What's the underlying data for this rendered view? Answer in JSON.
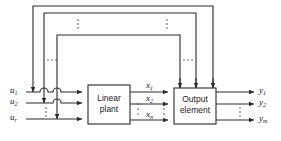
{
  "diagram": {
    "type": "block-diagram",
    "blocks": [
      {
        "id": "linear-plant",
        "label_line1": "Linear",
        "label_line2": "plant",
        "x": 88,
        "y": 85,
        "w": 42,
        "h": 39
      },
      {
        "id": "output-element",
        "label_line1": "Output",
        "label_line2": "element",
        "x": 174,
        "y": 88,
        "w": 42,
        "h": 36
      }
    ],
    "inputs": {
      "group_label": "u",
      "signals": [
        {
          "base": "u",
          "sub": "1",
          "y": 92
        },
        {
          "base": "u",
          "sub": "2",
          "y": 103
        },
        {
          "base": "u",
          "sub": "r",
          "y": 119
        }
      ],
      "ellipsis": "vertical"
    },
    "states": {
      "group_label": "x",
      "signals": [
        {
          "base": "x",
          "sub": "1",
          "y": 92
        },
        {
          "base": "x",
          "sub": "2",
          "y": 104
        },
        {
          "base": "x",
          "sub": "n",
          "y": 120
        }
      ],
      "ellipsis": "vertical"
    },
    "outputs": {
      "group_label": "y",
      "signals": [
        {
          "base": "y",
          "sub": "1",
          "y": 92
        },
        {
          "base": "y",
          "sub": "2",
          "y": 104
        },
        {
          "base": "y",
          "sub": "m",
          "y": 120
        }
      ],
      "ellipsis": "vertical"
    },
    "feedback_loops": [
      {
        "id": "loop-outer",
        "tap_x": 213,
        "top_y": 6,
        "left_x": 33,
        "enter_y": 92
      },
      {
        "id": "loop-middle",
        "tap_x": 196,
        "top_y": 13,
        "left_x": 44,
        "enter_y": 103
      },
      {
        "id": "loop-inner",
        "tap_x": 180,
        "top_y": 35,
        "left_x": 57,
        "enter_y": 119
      }
    ],
    "ellipses": [
      {
        "id": "top-left-horizontal-ellipsis",
        "orientation": "horizontal",
        "x": 52,
        "y": 60
      },
      {
        "id": "top-right-horizontal-ellipsis",
        "orientation": "horizontal",
        "x": 188,
        "y": 60
      },
      {
        "id": "top-left-vertical-ellipsis",
        "orientation": "vertical",
        "x": 78,
        "y": 25
      },
      {
        "id": "top-right-vertical-ellipsis",
        "orientation": "vertical",
        "x": 167,
        "y": 25
      },
      {
        "id": "input-vertical-ellipsis",
        "orientation": "vertical",
        "x": 46,
        "y": 112
      },
      {
        "id": "state-left-vertical-ellipsis",
        "orientation": "vertical",
        "x": 138,
        "y": 112
      },
      {
        "id": "state-right-vertical-ellipsis",
        "orientation": "vertical",
        "x": 164,
        "y": 112
      },
      {
        "id": "output-vertical-ellipsis",
        "orientation": "vertical",
        "x": 240,
        "y": 112
      }
    ],
    "colors": {
      "line": "#2a2a2a",
      "text": "#101010",
      "background": "#ffffff"
    }
  }
}
